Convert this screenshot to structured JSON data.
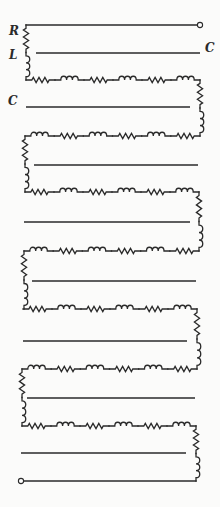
{
  "figure": {
    "colors": {
      "ink": "#2a2a2a",
      "background": "#fbfbfa"
    }
  },
  "labels": {
    "R": {
      "text": "R",
      "x": 9,
      "y": 31
    },
    "L": {
      "text": "L",
      "x": 9,
      "y": 55
    },
    "C_right": {
      "text": "C",
      "x": 205,
      "y": 48
    },
    "C_left": {
      "text": "C",
      "x": 8,
      "y": 101
    }
  },
  "terminals": [
    {
      "name": "input-terminal",
      "x": 200,
      "y": 25
    },
    {
      "name": "output-terminal",
      "x": 21,
      "y": 481
    }
  ],
  "top_wire": {
    "x1": 26,
    "x2": 197,
    "y": 25
  },
  "bottom_wire": {
    "x1": 24,
    "x2": 196,
    "y": 481
  },
  "first_left_riser": {
    "x": 26,
    "y_top": 25,
    "y_bot": 80,
    "sequence": [
      "R",
      "L"
    ]
  },
  "rows": [
    {
      "y": 80,
      "x1": 26,
      "x2": 200,
      "sequence": [
        "R",
        "L",
        "R",
        "L",
        "R",
        "L"
      ]
    },
    {
      "y": 136,
      "x1": 25,
      "x2": 200,
      "sequence": [
        "L",
        "R",
        "L",
        "R",
        "L",
        "R"
      ]
    },
    {
      "y": 192,
      "x1": 25,
      "x2": 199,
      "sequence": [
        "R",
        "L",
        "R",
        "L",
        "R",
        "L"
      ]
    },
    {
      "y": 251,
      "x1": 24,
      "x2": 199,
      "sequence": [
        "L",
        "R",
        "L",
        "R",
        "L",
        "R"
      ]
    },
    {
      "y": 309,
      "x1": 23,
      "x2": 197,
      "sequence": [
        "R",
        "L",
        "R",
        "L",
        "R",
        "L"
      ]
    },
    {
      "y": 369,
      "x1": 22,
      "x2": 197,
      "sequence": [
        "L",
        "R",
        "L",
        "R",
        "L",
        "R"
      ]
    },
    {
      "y": 426,
      "x1": 22,
      "x2": 196,
      "sequence": [
        "R",
        "L",
        "R",
        "L",
        "R",
        "L"
      ]
    }
  ],
  "risers": [
    {
      "side": "right",
      "x": 200,
      "y_top": 80,
      "y_bot": 136,
      "sequence": [
        "R",
        "L"
      ]
    },
    {
      "side": "left",
      "x": 25,
      "y_top": 136,
      "y_bot": 192,
      "sequence": [
        "R",
        "L"
      ]
    },
    {
      "side": "right",
      "x": 199,
      "y_top": 192,
      "y_bot": 251,
      "sequence": [
        "R",
        "L"
      ]
    },
    {
      "side": "left",
      "x": 24,
      "y_top": 251,
      "y_bot": 309,
      "sequence": [
        "R",
        "L"
      ]
    },
    {
      "side": "right",
      "x": 197,
      "y_top": 309,
      "y_bot": 369,
      "sequence": [
        "R",
        "L"
      ]
    },
    {
      "side": "left",
      "x": 22,
      "y_top": 369,
      "y_bot": 426,
      "sequence": [
        "R",
        "L"
      ]
    },
    {
      "side": "right",
      "x": 196,
      "y_top": 426,
      "y_bot": 481,
      "sequence": [
        "R",
        "L"
      ]
    }
  ],
  "capacitor_plates": [
    {
      "y": 53,
      "x1": 36,
      "x2": 200
    },
    {
      "y": 107,
      "x1": 26,
      "x2": 190
    },
    {
      "y": 165,
      "x1": 34,
      "x2": 198
    },
    {
      "y": 222,
      "x1": 24,
      "x2": 190
    },
    {
      "y": 281,
      "x1": 32,
      "x2": 196
    },
    {
      "y": 341,
      "x1": 23,
      "x2": 187
    },
    {
      "y": 398,
      "x1": 27,
      "x2": 195
    },
    {
      "y": 453,
      "x1": 21,
      "x2": 186
    }
  ]
}
